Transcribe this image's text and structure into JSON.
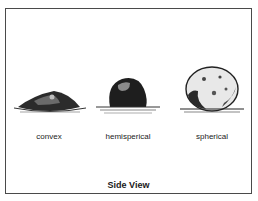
{
  "figure": {
    "title": "Side View",
    "shapes": [
      {
        "label": "convex"
      },
      {
        "label": "hemisperical"
      },
      {
        "label": "spherical"
      }
    ]
  }
}
